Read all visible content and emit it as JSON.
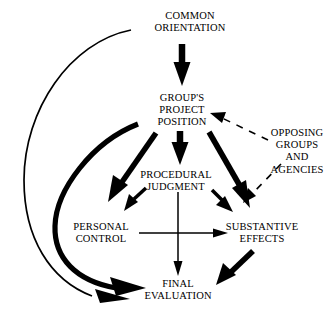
{
  "diagram": {
    "background_color": "#ffffff",
    "stroke_color": "#000000",
    "width": 336,
    "height": 316,
    "nodes": [
      {
        "id": "common-orientation",
        "name": "common-orientation",
        "lines": [
          "COMMON",
          "ORIENTATION"
        ],
        "x": 190,
        "y": 22
      },
      {
        "id": "groups-project-position",
        "name": "groups-project-position",
        "lines": [
          "GROUP'S",
          "PROJECT",
          "POSITION"
        ],
        "x": 182,
        "y": 110
      },
      {
        "id": "opposing-groups-and-agencies",
        "name": "opposing-groups-and-agencies",
        "lines": [
          "OPPOSING",
          "GROUPS",
          "AND",
          "AGENCIES"
        ],
        "x": 297,
        "y": 151
      },
      {
        "id": "procedural-judgment",
        "name": "procedural-judgment",
        "lines": [
          "PROCEDURAL",
          "JUDGMENT"
        ],
        "x": 176,
        "y": 181
      },
      {
        "id": "personal-control",
        "name": "personal-control",
        "lines": [
          "PERSONAL",
          "CONTROL"
        ],
        "x": 101,
        "y": 233
      },
      {
        "id": "substantive-effects",
        "name": "substantive-effects",
        "lines": [
          "SUBSTANTIVE",
          "EFFECTS"
        ],
        "x": 262,
        "y": 233
      },
      {
        "id": "final-evaluation",
        "name": "final-evaluation",
        "lines": [
          "FINAL",
          "EVALUATION"
        ],
        "x": 178,
        "y": 290
      }
    ],
    "edges": [
      {
        "id": "common-orientation-to-groups-project-position",
        "from": "common-orientation",
        "to": "groups-project-position",
        "style": "thick-solid"
      },
      {
        "id": "common-orientation-to-final-evaluation",
        "from": "common-orientation",
        "to": "final-evaluation",
        "style": "thin-curve"
      },
      {
        "id": "groups-project-position-to-procedural-judgment",
        "from": "groups-project-position",
        "to": "procedural-judgment",
        "style": "thick-solid"
      },
      {
        "id": "groups-project-position-to-personal-control",
        "from": "groups-project-position",
        "to": "personal-control",
        "style": "thick-solid"
      },
      {
        "id": "groups-project-position-to-substantive-effects",
        "from": "groups-project-position",
        "to": "substantive-effects",
        "style": "thick-solid"
      },
      {
        "id": "groups-project-position-to-final-evaluation",
        "from": "groups-project-position",
        "to": "final-evaluation",
        "style": "thick-curve"
      },
      {
        "id": "procedural-judgment-to-personal-control",
        "from": "procedural-judgment",
        "to": "personal-control",
        "style": "medium-solid"
      },
      {
        "id": "procedural-judgment-to-substantive-effects",
        "from": "procedural-judgment",
        "to": "substantive-effects",
        "style": "medium-solid"
      },
      {
        "id": "procedural-judgment-to-final-evaluation",
        "from": "procedural-judgment",
        "to": "final-evaluation",
        "style": "thin-solid"
      },
      {
        "id": "personal-control-to-substantive-effects",
        "from": "personal-control",
        "to": "substantive-effects",
        "style": "thin-solid"
      },
      {
        "id": "substantive-effects-to-final-evaluation",
        "from": "substantive-effects",
        "to": "final-evaluation",
        "style": "thick-solid"
      },
      {
        "id": "opposing-groups-to-groups-project-position",
        "from": "opposing-groups-and-agencies",
        "to": "groups-project-position",
        "style": "dashed"
      },
      {
        "id": "opposing-groups-to-substantive-effects",
        "from": "opposing-groups-and-agencies",
        "to": "substantive-effects",
        "style": "dashed"
      }
    ]
  }
}
